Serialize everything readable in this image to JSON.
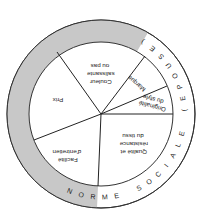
{
  "diagram": {
    "orientation": "rotated 180 degrees",
    "outer_ring": {
      "label_letters": [
        "N",
        "O",
        "R",
        "M",
        "E",
        " ",
        "S",
        "O",
        "C",
        "I",
        "A",
        "L",
        "E",
        " ",
        "(",
        "E",
        "P",
        "O",
        "U",
        "S",
        "E",
        ")"
      ],
      "label": "NORME SOCIALE (EPOUSE)",
      "fill": "#c8c8c8"
    },
    "segments": [
      {
        "id": "qualite",
        "lines": [
          "Qualité et",
          "résistance",
          "du tissu"
        ]
      },
      {
        "id": "originalite",
        "lines": [
          "Originalité",
          "du style"
        ]
      },
      {
        "id": "marque",
        "lines": [
          "Marque"
        ]
      },
      {
        "id": "couleur",
        "lines": [
          "Couleur",
          "salissante",
          "ou pas"
        ]
      },
      {
        "id": "prix",
        "lines": [
          "Prix"
        ]
      },
      {
        "id": "facilite",
        "lines": [
          "Facilité",
          "d'entretien"
        ]
      }
    ]
  }
}
